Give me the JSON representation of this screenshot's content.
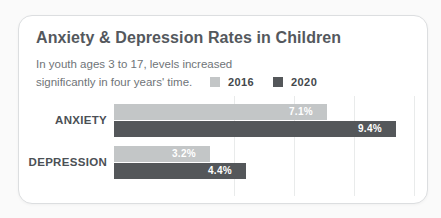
{
  "chart_data": {
    "type": "bar",
    "orientation": "horizontal",
    "title": "Anxiety & Depression Rates in Children",
    "subtitle_lines": [
      "In youth ages 3 to 17, levels increased",
      "significantly in four years' time."
    ],
    "categories": [
      "ANXIETY",
      "DEPRESSION"
    ],
    "series": [
      {
        "name": "2016",
        "color": "#c3c6c7",
        "values": [
          7.1,
          3.2
        ],
        "labels": [
          "7.1%",
          "3.2%"
        ]
      },
      {
        "name": "2020",
        "color": "#54575a",
        "values": [
          9.4,
          4.4
        ],
        "labels": [
          "9.4%",
          "4.4%"
        ]
      }
    ],
    "unit": "%",
    "xlim": [
      0,
      10.5
    ],
    "gridlines_percent": [
      4,
      6,
      8,
      10
    ],
    "legend_position": "top-right",
    "grid": true,
    "px_per_unit": 30,
    "bar_origin_x": 95
  },
  "colors": {
    "card_background": "#ffffff",
    "card_border": "#dcdee0",
    "title_text": "#54585d",
    "subtitle_text": "#6f7478",
    "category_text": "#4b5055",
    "value_text": "#ffffff",
    "gridline": "#e9ebeb"
  }
}
